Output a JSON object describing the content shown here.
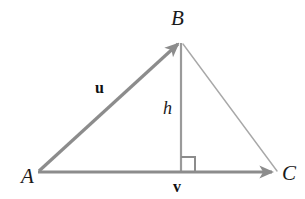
{
  "diagram": {
    "type": "geometry-vector-triangle",
    "background_color": "#ffffff",
    "vertices": [
      {
        "name": "A",
        "label": "A",
        "x": 38,
        "y": 172
      },
      {
        "name": "B",
        "label": "B",
        "x": 181,
        "y": 41
      },
      {
        "name": "C",
        "label": "C",
        "x": 276,
        "y": 172
      }
    ],
    "vectors": [
      {
        "name": "u",
        "label": "u",
        "from": "A",
        "to": "B",
        "arrowhead": true,
        "color": "#8c8c8c",
        "stroke_width": 3.2,
        "label_x": 102,
        "label_y": 88
      },
      {
        "name": "v",
        "label": "v",
        "from": "A",
        "to": "C",
        "arrowhead": true,
        "color": "#8c8c8c",
        "stroke_width": 3.2,
        "label_x": 179,
        "label_y": 186
      }
    ],
    "segments": [
      {
        "name": "side-BC",
        "from": "B",
        "to": "C",
        "arrowhead": false,
        "color": "#a8a8a8",
        "stroke_width": 1.4
      },
      {
        "name": "altitude-h",
        "label": "h",
        "from_x": 181,
        "from_y": 42,
        "to_x": 181,
        "to_y": 172,
        "arrowhead": false,
        "color": "#9a9a9a",
        "stroke_width": 2.2,
        "label_x": 170,
        "label_y": 108
      }
    ],
    "right_angle_marker": {
      "name": "right-angle",
      "corner_x": 181,
      "corner_y": 172,
      "size": 14,
      "direction": "right",
      "color": "#8c8c8c",
      "stroke_width": 2
    },
    "labels": {
      "vertex_A": "A",
      "vertex_B": "B",
      "vertex_C": "C",
      "vector_u": "u",
      "vector_v": "v",
      "height_h": "h"
    },
    "colors": {
      "vector_gray": "#8c8c8c",
      "thin_line_gray": "#a8a8a8",
      "altitude_gray": "#9a9a9a",
      "text_black": "#1a1a1a",
      "background": "#ffffff"
    }
  }
}
